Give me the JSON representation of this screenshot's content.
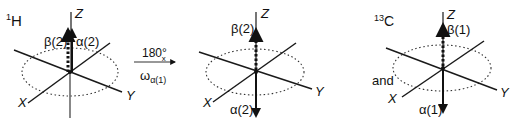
{
  "panels": [
    {
      "nucleus": "1H",
      "nucleus_mass": "1",
      "nucleus_symbol": "H",
      "axes": {
        "z": "Z",
        "x": "X",
        "y": "Y"
      },
      "vectors": [
        {
          "label": "β(2)",
          "direction": "up",
          "style": "dotted"
        },
        {
          "label": "α(2)",
          "direction": "up",
          "style": "solid"
        }
      ]
    },
    {
      "axes": {
        "z": "Z",
        "x": "X",
        "y": "Y"
      },
      "vectors": [
        {
          "label": "β(2)",
          "direction": "up",
          "style": "dotted"
        },
        {
          "label": "α(2)",
          "direction": "down",
          "style": "solid"
        }
      ]
    },
    {
      "nucleus": "13C",
      "nucleus_mass": "13",
      "nucleus_symbol": "C",
      "axes": {
        "z": "Z",
        "x": "X",
        "y": "Y"
      },
      "vectors": [
        {
          "label": "β(1)",
          "direction": "up",
          "style": "dotted"
        },
        {
          "label": "α(1)",
          "direction": "down",
          "style": "solid"
        }
      ]
    }
  ],
  "transition": {
    "pulse_angle": "180°",
    "pulse_axis": "x",
    "frequency_symbol": "ω",
    "frequency_subscript": "α(1)"
  },
  "conjunction": "and",
  "colors": {
    "ink": "#111111",
    "axis": "#1a1a1a",
    "background": "#ffffff"
  }
}
